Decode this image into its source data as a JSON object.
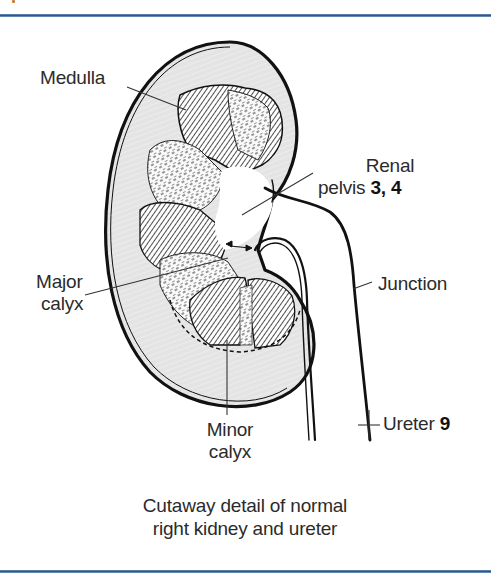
{
  "figure": {
    "caption_line1": "Cutaway detail of normal",
    "caption_line2": "right kidney and ureter",
    "colors": {
      "border_rule": "#2c5a8c",
      "cortex_fill": "#e6e6e6",
      "line": "#1a1a1a",
      "text": "#2b2b2b"
    }
  },
  "labels": {
    "medulla": "Medulla",
    "renal_pelvis_line1": "Renal",
    "renal_pelvis_line2": "pelvis",
    "renal_pelvis_ref": "3, 4",
    "junction": "Junction",
    "major_calyx_line1": "Major",
    "major_calyx_line2": "calyx",
    "minor_calyx_line1": "Minor",
    "minor_calyx_line2": "calyx",
    "ureter": "Ureter",
    "ureter_ref": "9"
  }
}
